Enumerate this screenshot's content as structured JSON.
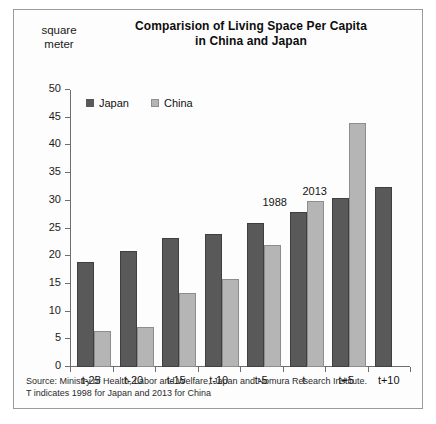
{
  "chart_data": {
    "type": "bar",
    "title": "Comparision of Living Space Per Capita in China and Japan",
    "title_line1": "Comparision of Living Space Per Capita",
    "title_line2": "in China and Japan",
    "xlabel": "",
    "ylabel": "square meter",
    "ylabel_line1": "square",
    "ylabel_line2": "meter",
    "ylim": [
      0,
      50
    ],
    "ytick_step": 5,
    "yticks": [
      0,
      5,
      10,
      15,
      20,
      25,
      30,
      35,
      40,
      45,
      50
    ],
    "grid": false,
    "legend_position": "top-left-inside",
    "categories": [
      "t-25",
      "t-20",
      "t-15",
      "t-10",
      "t-5",
      "t",
      "t+5",
      "t+10"
    ],
    "series": [
      {
        "name": "Japan",
        "color": "#595959",
        "values": [
          19,
          21,
          23.3,
          24,
          26,
          28,
          30.5,
          32.5
        ]
      },
      {
        "name": "China",
        "color": "#b5b5b5",
        "values": [
          6.5,
          7.2,
          13.3,
          15.8,
          22,
          30,
          44,
          null
        ]
      }
    ],
    "annotations": [
      {
        "text": "1988",
        "category": "t",
        "series": "Japan"
      },
      {
        "text": "2013",
        "category": "t",
        "series": "China"
      }
    ],
    "footnote_line1": "Source: Ministry of Health, Labor and Welfare, Japan and Nomura Research Institute.",
    "footnote_line2": "T indicates 1998 for Japan and 2013 for China"
  }
}
